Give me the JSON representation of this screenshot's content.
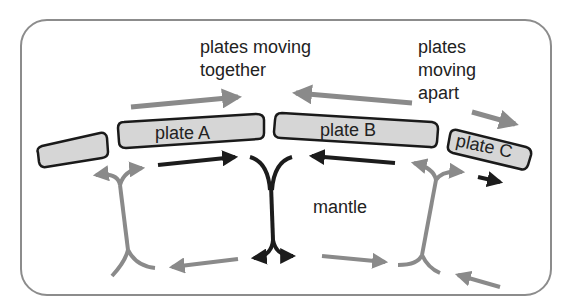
{
  "labels": {
    "together_line1": "plates moving",
    "together_line2": "together",
    "apart_line1": "plates",
    "apart_line2": "moving",
    "apart_line3": "apart",
    "mantle": "mantle"
  },
  "plates": [
    {
      "name": "unlabeled",
      "label": ""
    },
    {
      "name": "plate-a",
      "label": "plate A"
    },
    {
      "name": "plate-b",
      "label": "plate B"
    },
    {
      "name": "plate-c",
      "label": "plate C"
    }
  ],
  "colors": {
    "frame": "#8c8c8c",
    "plate_fill": "#d6d6d6",
    "plate_stroke": "#1a1a1a",
    "gray_arrow": "#8a8a8a",
    "dark_arrow": "#1c1c1c",
    "text": "#222222"
  }
}
